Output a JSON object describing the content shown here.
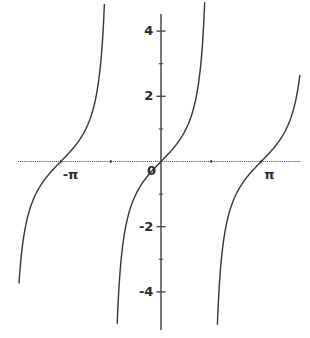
{
  "chart_data": {
    "type": "line",
    "title": "",
    "subtitle": "",
    "xlabel": "",
    "ylabel": "",
    "function": "y = tan(x)",
    "xlim": [
      -4.45,
      4.35
    ],
    "ylim": [
      -5.0,
      5.0
    ],
    "grid": false,
    "legend": null,
    "axis_color": "#4a4a4a",
    "curve_color": "#3a3a3a",
    "background": "#ffffff",
    "x_axis_visible": true,
    "y_axis_visible": true,
    "asymptotes": [
      -1.5707963,
      1.5707963,
      4.712389
    ],
    "branches": [
      {
        "name": "branch-left",
        "x_start": -4.45,
        "x_end": -1.5707963
      },
      {
        "name": "branch-center",
        "x_start": -1.5707963,
        "x_end": 1.5707963
      },
      {
        "name": "branch-right",
        "x_start": 1.5707963,
        "x_end": 4.712389
      }
    ],
    "zero_crossings": [
      -3.1415927,
      0,
      3.1415927
    ],
    "y_ticks": [
      {
        "value": 4,
        "label": "4"
      },
      {
        "value": 3,
        "label": ""
      },
      {
        "value": 2,
        "label": "2"
      },
      {
        "value": 1,
        "label": ""
      },
      {
        "value": -1,
        "label": ""
      },
      {
        "value": -2,
        "label": "-2"
      },
      {
        "value": -3,
        "label": ""
      },
      {
        "value": -4,
        "label": "-4"
      }
    ],
    "x_ticks": [
      {
        "value": -3.1415927,
        "label": "-π"
      },
      {
        "value": -1.5707963,
        "label": ""
      },
      {
        "value": 1.5707963,
        "label": ""
      },
      {
        "value": 3.1415927,
        "label": "π"
      }
    ],
    "origin": {
      "label": "0",
      "value": 0
    }
  },
  "labels": {
    "y_4": "4",
    "y_2": "2",
    "y_neg2": "-2",
    "y_neg4": "-4",
    "origin": "0",
    "x_neg_pi": "-π",
    "x_pi": "π"
  }
}
